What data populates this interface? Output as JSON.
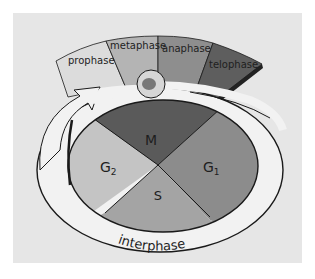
{
  "diagram": {
    "mitosis_phases": [
      {
        "label": "prophase",
        "color": "#dcdcdc"
      },
      {
        "label": "metaphase",
        "color": "#b4b4b4"
      },
      {
        "label": "anaphase",
        "color": "#8e8e8e"
      },
      {
        "label": "telophase",
        "color": "#5e5e5e"
      }
    ],
    "cycle_sectors": [
      {
        "label": "M",
        "color": "#5a5a5a"
      },
      {
        "label": "G",
        "subscript": "1",
        "color": "#8c8c8c"
      },
      {
        "label": "S",
        "color": "#a4a4a4"
      },
      {
        "label": "G",
        "subscript": "2",
        "color": "#c4c4c4"
      }
    ],
    "outer_ring_label": "interphase",
    "colors": {
      "background": "#e6e6e6",
      "ring": "#f2f2f2",
      "outline": "#1a1a1a",
      "cell": "#d6d6d6",
      "nucleus": "#777777"
    }
  }
}
